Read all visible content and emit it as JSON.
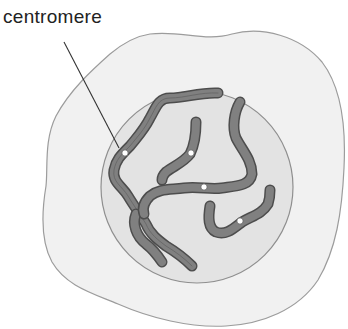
{
  "diagram": {
    "labels": {
      "centromere": "centromere"
    },
    "colors": {
      "background": "#ffffff",
      "cytoplasm_fill": "#f0f0f0",
      "cytoplasm_stroke": "#9a9a9a",
      "nucleus_fill": "#e2e2e2",
      "nucleus_stroke": "#8f8f8f",
      "chromosome_fill": "#7d7d7d",
      "chromosome_edge": "#4a4a4a",
      "centromere_fill": "#ffffff",
      "leader_line": "#333333"
    },
    "chromosome_count": 6,
    "centromere_count": 5
  }
}
